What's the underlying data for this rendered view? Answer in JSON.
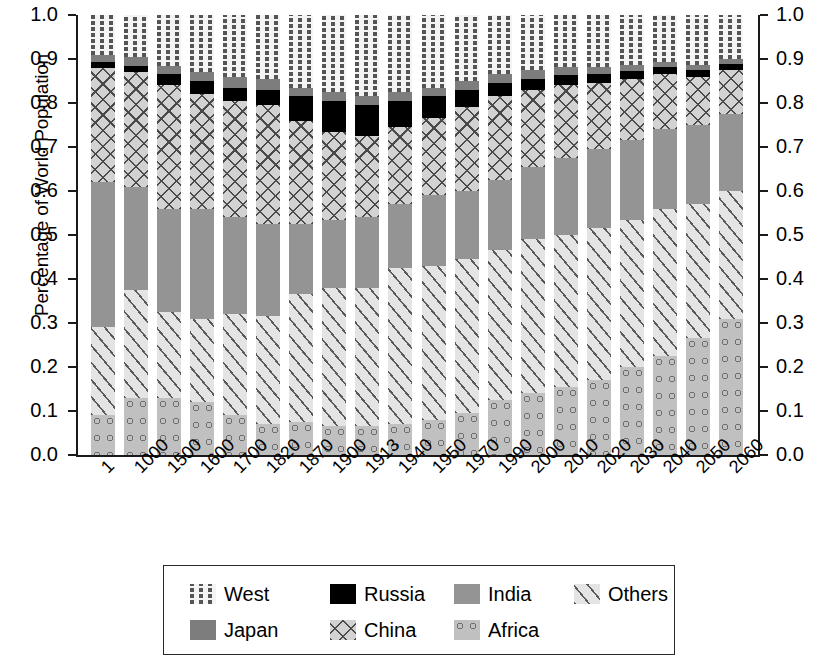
{
  "chart_data": {
    "type": "bar",
    "stacked": true,
    "title": "",
    "xlabel": "",
    "ylabel": "Percentage of World Population",
    "ylim": [
      0.0,
      1.0
    ],
    "ytick_labels": [
      "0.0",
      "0.1",
      "0.2",
      "0.3",
      "0.4",
      "0.5",
      "0.6",
      "0.7",
      "0.8",
      "0.9",
      "1.0"
    ],
    "ytick_values": [
      0.0,
      0.1,
      0.2,
      0.3,
      0.4,
      0.5,
      0.6,
      0.7,
      0.8,
      0.9,
      1.0
    ],
    "right_axis": true,
    "right_ytick_labels": [
      "0.0",
      "0.1",
      "0.2",
      "0.3",
      "0.4",
      "0.5",
      "0.6",
      "0.7",
      "0.8",
      "0.9",
      "1.0"
    ],
    "grid": false,
    "legend_position": "below",
    "categories": [
      "1",
      "1000",
      "1500",
      "1600",
      "1700",
      "1820",
      "1870",
      "1900",
      "1913",
      "1940",
      "1950",
      "1970",
      "1990",
      "2000",
      "2010",
      "2020",
      "2030",
      "2040",
      "2050",
      "2060"
    ],
    "stack_order_bottom_to_top": [
      "Africa",
      "Others",
      "India",
      "China",
      "Russia",
      "Japan",
      "West"
    ],
    "series": [
      {
        "name": "Africa",
        "color": "#c0c0c0",
        "pattern": "circles",
        "values": [
          0.09,
          0.13,
          0.13,
          0.12,
          0.09,
          0.07,
          0.075,
          0.065,
          0.065,
          0.07,
          0.08,
          0.095,
          0.125,
          0.14,
          0.155,
          0.17,
          0.2,
          0.225,
          0.265,
          0.31
        ]
      },
      {
        "name": "Others",
        "color": "#e4e4e4",
        "pattern": "diagonal-lines",
        "values": [
          0.2,
          0.245,
          0.195,
          0.19,
          0.23,
          0.245,
          0.29,
          0.315,
          0.315,
          0.355,
          0.35,
          0.35,
          0.34,
          0.35,
          0.345,
          0.345,
          0.335,
          0.335,
          0.305,
          0.29
        ]
      },
      {
        "name": "India",
        "color": "#949494",
        "pattern": "solid-gray",
        "values": [
          0.33,
          0.235,
          0.235,
          0.25,
          0.22,
          0.21,
          0.16,
          0.155,
          0.16,
          0.145,
          0.16,
          0.155,
          0.16,
          0.165,
          0.175,
          0.18,
          0.18,
          0.18,
          0.18,
          0.175
        ]
      },
      {
        "name": "China",
        "color": "#d2d2d2",
        "pattern": "crosshatch",
        "values": [
          0.26,
          0.26,
          0.28,
          0.26,
          0.265,
          0.27,
          0.235,
          0.2,
          0.185,
          0.175,
          0.175,
          0.19,
          0.19,
          0.175,
          0.165,
          0.15,
          0.14,
          0.125,
          0.11,
          0.1
        ]
      },
      {
        "name": "Russia",
        "color": "#000000",
        "pattern": "solid-black",
        "values": [
          0.013,
          0.015,
          0.025,
          0.03,
          0.03,
          0.035,
          0.055,
          0.07,
          0.07,
          0.06,
          0.05,
          0.04,
          0.03,
          0.025,
          0.023,
          0.02,
          0.018,
          0.016,
          0.014,
          0.013
        ]
      },
      {
        "name": "Japan",
        "color": "#7d7d7d",
        "pattern": "dark-gray",
        "values": [
          0.017,
          0.02,
          0.02,
          0.02,
          0.025,
          0.025,
          0.02,
          0.02,
          0.02,
          0.02,
          0.02,
          0.02,
          0.02,
          0.02,
          0.018,
          0.016,
          0.014,
          0.013,
          0.012,
          0.011
        ]
      },
      {
        "name": "West",
        "color": "#f4f4f4",
        "pattern": "dashes",
        "values": [
          0.09,
          0.095,
          0.115,
          0.13,
          0.14,
          0.145,
          0.165,
          0.175,
          0.185,
          0.175,
          0.165,
          0.15,
          0.135,
          0.125,
          0.119,
          0.119,
          0.113,
          0.106,
          0.114,
          0.101
        ]
      }
    ]
  },
  "legend": {
    "items": [
      {
        "label": "West",
        "pattern": "dashes"
      },
      {
        "label": "Russia",
        "pattern": "solid-black"
      },
      {
        "label": "India",
        "pattern": "solid-gray"
      },
      {
        "label": "Others",
        "pattern": "diagonal-lines"
      },
      {
        "label": "Japan",
        "pattern": "dark-gray"
      },
      {
        "label": "China",
        "pattern": "crosshatch"
      },
      {
        "label": "Africa",
        "pattern": "circles"
      }
    ]
  }
}
